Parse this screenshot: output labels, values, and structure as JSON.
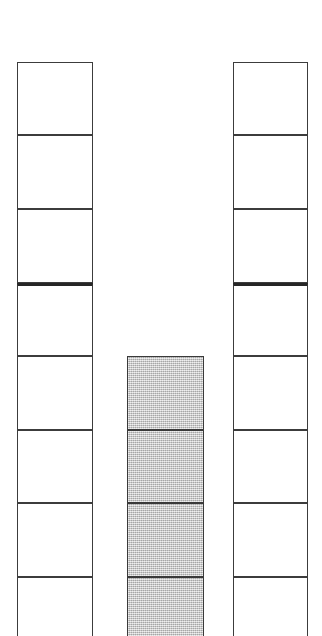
{
  "figure": {
    "background_color": "#ffffff",
    "width": 322,
    "height": 636,
    "line_color": "#3c3c3c",
    "emphasis_line_color": "#262626",
    "fill_color": "#b9b9b9",
    "empty_color": "#ffffff"
  },
  "chart_data": {
    "type": "bar",
    "orientation": "vertical-stacked-cells",
    "subtitle": "",
    "xlabel": "",
    "ylabel": "",
    "grid": false,
    "legend": null,
    "categories": [
      "left-column",
      "middle-column",
      "right-column"
    ],
    "cell_height_px": 73.5,
    "series": [
      {
        "name": "empty-cells",
        "values": [
          8,
          0,
          8
        ]
      },
      {
        "name": "filled-cells",
        "values": [
          0,
          4,
          0
        ]
      }
    ],
    "columns": [
      {
        "id": "left-column",
        "x": 17,
        "width": 76,
        "top": 62,
        "cell_count": 8,
        "clipped_at_bottom": true,
        "emphasis_rule_after_cell": 3,
        "cells": [
          {
            "index": 1,
            "fill": "empty",
            "top": 62,
            "height": 73
          },
          {
            "index": 2,
            "fill": "empty",
            "top": 135,
            "height": 74
          },
          {
            "index": 3,
            "fill": "empty",
            "top": 209,
            "height": 74
          },
          {
            "index": 4,
            "fill": "empty",
            "top": 283,
            "height": 73
          },
          {
            "index": 5,
            "fill": "empty",
            "top": 356,
            "height": 74
          },
          {
            "index": 6,
            "fill": "empty",
            "top": 430,
            "height": 73
          },
          {
            "index": 7,
            "fill": "empty",
            "top": 503,
            "height": 74
          },
          {
            "index": 8,
            "fill": "empty",
            "top": 577,
            "height": 59,
            "clipped": true
          }
        ]
      },
      {
        "id": "middle-column",
        "x": 127,
        "width": 77,
        "top": 356,
        "cell_count": 4,
        "clipped_at_bottom": true,
        "emphasis_rule_after_cell": null,
        "cells": [
          {
            "index": 1,
            "fill": "filled",
            "top": 356,
            "height": 74
          },
          {
            "index": 2,
            "fill": "filled",
            "top": 430,
            "height": 73
          },
          {
            "index": 3,
            "fill": "filled",
            "top": 503,
            "height": 74
          },
          {
            "index": 4,
            "fill": "filled",
            "top": 577,
            "height": 59,
            "clipped": true
          }
        ]
      },
      {
        "id": "right-column",
        "x": 233,
        "width": 75,
        "top": 62,
        "cell_count": 8,
        "clipped_at_bottom": true,
        "emphasis_rule_after_cell": 3,
        "cells": [
          {
            "index": 1,
            "fill": "empty",
            "top": 62,
            "height": 73
          },
          {
            "index": 2,
            "fill": "empty",
            "top": 135,
            "height": 74
          },
          {
            "index": 3,
            "fill": "empty",
            "top": 209,
            "height": 74
          },
          {
            "index": 4,
            "fill": "empty",
            "top": 283,
            "height": 73
          },
          {
            "index": 5,
            "fill": "empty",
            "top": 356,
            "height": 74
          },
          {
            "index": 6,
            "fill": "empty",
            "top": 430,
            "height": 73
          },
          {
            "index": 7,
            "fill": "empty",
            "top": 503,
            "height": 74
          },
          {
            "index": 8,
            "fill": "empty",
            "top": 577,
            "height": 59,
            "clipped": true
          }
        ]
      }
    ]
  }
}
